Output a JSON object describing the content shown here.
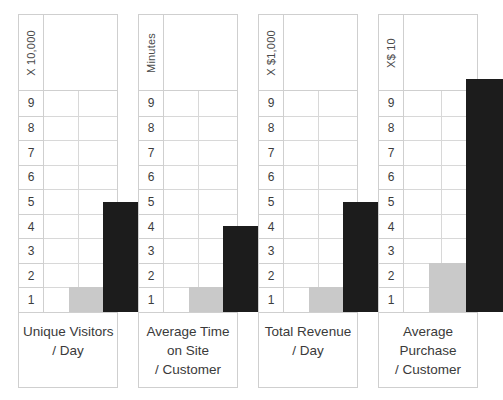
{
  "chart_data": {
    "type": "bar",
    "title": "",
    "orientation": "vertical",
    "grid": true,
    "legend": null,
    "ylim": [
      0,
      10
    ],
    "yticks": [
      9,
      8,
      7,
      6,
      5,
      4,
      3,
      2,
      1
    ],
    "series": [
      {
        "name": "before",
        "color": "#c9c9c9"
      },
      {
        "name": "after",
        "color": "#1c1c1c"
      }
    ],
    "panels": [
      {
        "id": "unique-visitors",
        "unit_label": "X 10,000",
        "caption_lines": [
          "Unique Visitors",
          "/ Day"
        ],
        "values": {
          "before": 1,
          "after": 4.5
        }
      },
      {
        "id": "average-time-on-site",
        "unit_label": "Minutes",
        "caption_lines": [
          "Average Time",
          "on Site",
          "/ Customer"
        ],
        "values": {
          "before": 1,
          "after": 3.5
        }
      },
      {
        "id": "total-revenue",
        "unit_label": "X $1,000",
        "caption_lines": [
          "Total Revenue",
          "/ Day"
        ],
        "values": {
          "before": 1,
          "after": 4.5
        }
      },
      {
        "id": "average-purchase",
        "unit_label": "X$ 10",
        "caption_lines": [
          "Average",
          "Purchase",
          "/ Customer"
        ],
        "values": {
          "before": 2,
          "after": 9.5
        }
      }
    ]
  },
  "layout": {
    "panel_geometry": [
      {
        "left": 18,
        "width": 100,
        "bar_light": {
          "left": 25,
          "width": 34
        },
        "bar_dark": {
          "left": 59,
          "width": 39
        },
        "divider": 34
      },
      {
        "left": 138,
        "width": 100,
        "bar_light": {
          "left": 25,
          "width": 34
        },
        "bar_dark": {
          "left": 59,
          "width": 39
        },
        "divider": 34
      },
      {
        "left": 258,
        "width": 100,
        "bar_light": {
          "left": 25,
          "width": 34
        },
        "bar_dark": {
          "left": 59,
          "width": 39
        },
        "divider": 34
      },
      {
        "left": 378,
        "width": 100,
        "bar_light": {
          "left": 25,
          "width": 37
        },
        "bar_dark": {
          "left": 62,
          "width": 37
        },
        "divider": 37
      }
    ]
  }
}
